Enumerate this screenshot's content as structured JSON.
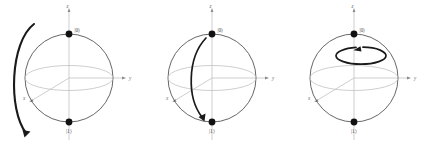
{
  "figure": {
    "title": "",
    "background_color": "#ffffff",
    "panel_count": 3
  },
  "style": {
    "sphere_outline_color": "#4a4a4a",
    "equator_color": "#c2c2c2",
    "axis_color": "#b9b9b9",
    "arrow_color": "#1a1a1a",
    "label_color": "#6d6d6d",
    "pole_dot_color": "#111111"
  },
  "labels": {
    "axis_z": "z",
    "axis_y": "y",
    "axis_x": "x",
    "ket_zero": "|0⟩",
    "ket_one": "|1⟩"
  },
  "panels": [
    {
      "id": "panel-1",
      "name": "bloch-sphere-external-arc",
      "arrow_kind": "external-meridian-arc",
      "arrow_direction": "top-to-bottom",
      "axis_z": "z",
      "axis_y": "y",
      "axis_x": "x",
      "ket_zero": "|0⟩",
      "ket_one": "|1⟩"
    },
    {
      "id": "panel-2",
      "name": "bloch-sphere-internal-arc",
      "arrow_kind": "internal-meridian-arc",
      "arrow_direction": "top-to-bottom",
      "axis_z": "z",
      "axis_y": "y",
      "axis_x": "x",
      "ket_zero": "|0⟩",
      "ket_one": "|1⟩"
    },
    {
      "id": "panel-3",
      "name": "bloch-sphere-z-rotation",
      "arrow_kind": "horizontal-ellipse-loop",
      "arrow_direction": "counterclockwise-about-z",
      "axis_z": "z",
      "axis_y": "y",
      "axis_x": "x",
      "ket_zero": "|0⟩",
      "ket_one": "|1⟩"
    }
  ]
}
